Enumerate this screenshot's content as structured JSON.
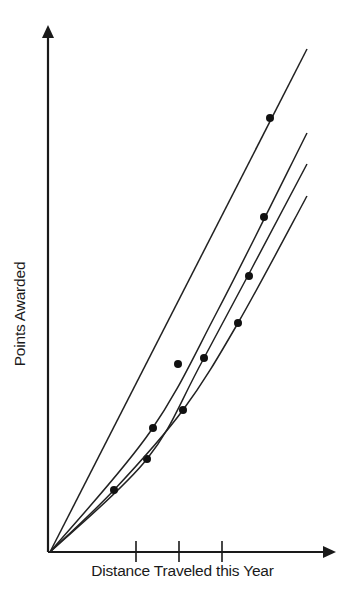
{
  "chart_data": {
    "type": "line",
    "title": "",
    "xlabel": "Distance Traveled this Year",
    "ylabel": "Points Awarded",
    "x_ticks": [
      1,
      2,
      3
    ],
    "x_tick_labels": [
      "",
      "",
      ""
    ],
    "grid": false,
    "legend": null,
    "axis_color": "#1a1a1a",
    "line_color": "#222222",
    "series": [
      {
        "name": "Line 1",
        "path_px": [
          [
            50,
            552
          ],
          [
            307,
            49
          ]
        ],
        "points_px": [
          [
            270,
            118
          ]
        ]
      },
      {
        "name": "Line 2",
        "path_px": [
          [
            50,
            552
          ],
          [
            150,
            432
          ],
          [
            218,
            310
          ],
          [
            307,
            133
          ]
        ],
        "points_px": [
          [
            153,
            428
          ],
          [
            178,
            364
          ],
          [
            264,
            217
          ]
        ]
      },
      {
        "name": "Line 3",
        "path_px": [
          [
            50,
            552
          ],
          [
            147,
            459
          ],
          [
            204,
            358
          ],
          [
            307,
            164
          ]
        ],
        "points_px": [
          [
            147,
            459
          ],
          [
            204,
            358
          ],
          [
            249,
            276
          ]
        ]
      },
      {
        "name": "Line 4",
        "path_px": [
          [
            50,
            552
          ],
          [
            114,
            490
          ],
          [
            183,
            410
          ],
          [
            238,
            323
          ],
          [
            307,
            196
          ]
        ],
        "points_px": [
          [
            114,
            490
          ],
          [
            183,
            410
          ],
          [
            238,
            323
          ]
        ]
      }
    ],
    "axes_px": {
      "origin": [
        50,
        552
      ],
      "y_top": [
        48,
        25
      ],
      "x_right": [
        336,
        552
      ],
      "tick_x": [
        136,
        179,
        222
      ]
    }
  }
}
